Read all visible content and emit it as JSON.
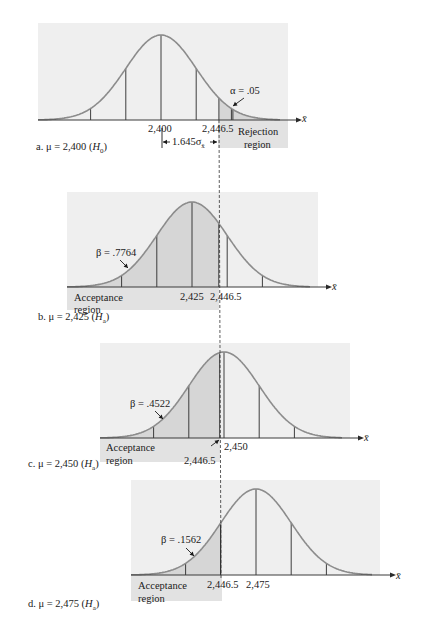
{
  "chart_data": [
    {
      "type": "area",
      "title": "a. μ = 2,400 (H0)",
      "panel": "a",
      "mu": 2400,
      "hypothesis": "H0",
      "xlabel": "x̄",
      "tick_labels": [
        "2,400",
        "2,446.5"
      ],
      "critical_value": 2446.5,
      "shaded_region": "right tail (rejection region)",
      "annotations": [
        "α = .05",
        "1.645σx̄",
        "Rejection region"
      ],
      "alpha": 0.05
    },
    {
      "type": "area",
      "title": "b. μ = 2,425 (Ha)",
      "panel": "b",
      "mu": 2425,
      "hypothesis": "Ha",
      "xlabel": "x̄",
      "tick_labels": [
        "2,425",
        "2,446.5"
      ],
      "critical_value": 2446.5,
      "shaded_region": "left of critical value (acceptance region)",
      "annotations": [
        "β = .7764",
        "Acceptance region"
      ],
      "beta": 0.7764
    },
    {
      "type": "area",
      "title": "c. μ = 2,450 (Ha)",
      "panel": "c",
      "mu": 2450,
      "hypothesis": "Ha",
      "xlabel": "x̄",
      "tick_labels": [
        "2,446.5",
        "2,450"
      ],
      "critical_value": 2446.5,
      "shaded_region": "left of critical value (acceptance region)",
      "annotations": [
        "β = .4522",
        "Acceptance region"
      ],
      "beta": 0.4522
    },
    {
      "type": "area",
      "title": "d. μ = 2,475 (Ha)",
      "panel": "d",
      "mu": 2475,
      "hypothesis": "Ha",
      "xlabel": "x̄",
      "tick_labels": [
        "2,446.5",
        "2,475"
      ],
      "critical_value": 2446.5,
      "shaded_region": "left of critical value (acceptance region)",
      "annotations": [
        "β = .1562",
        "Acceptance region"
      ],
      "beta": 0.1562
    }
  ],
  "panels": {
    "a": {
      "caption_prefix": "a. μ = 2,400 (",
      "caption_h": "H",
      "caption_sub": "0",
      "caption_suffix": ")",
      "tick_mu": "2,400",
      "tick_crit": "2,446.5",
      "alpha_label": "α = .05",
      "sigma_label": "1.645σ",
      "sigma_sub": "x̄",
      "region_line1": "Rejection",
      "region_line2": "region",
      "axis_label": "x̄"
    },
    "b": {
      "caption_prefix": "b. μ = 2,425 (",
      "caption_h": "H",
      "caption_sub": "a",
      "caption_suffix": ")",
      "tick_mu": "2,425",
      "tick_crit": "2,446.5",
      "beta_label": "β = .7764",
      "region_line1": "Acceptance",
      "region_line2": "region",
      "axis_label": "x̄"
    },
    "c": {
      "caption_prefix": "c. μ = 2,450 (",
      "caption_h": "H",
      "caption_sub": "a",
      "caption_suffix": ")",
      "tick_mu": "2,450",
      "tick_crit": "2,446.5",
      "beta_label": "β = .4522",
      "region_line1": "Acceptance",
      "region_line2": "region",
      "axis_label": "x̄"
    },
    "d": {
      "caption_prefix": "d. μ = 2,475 (",
      "caption_h": "H",
      "caption_sub": "a",
      "caption_suffix": ")",
      "tick_mu": "2,475",
      "tick_crit": "2,446.5",
      "beta_label": "β = .1562",
      "region_line1": "Acceptance",
      "region_line2": "region",
      "axis_label": "x̄"
    }
  },
  "colors": {
    "panel_bg": "#efefef",
    "shade": "#d6d6d6",
    "region_box": "#e2e2e2",
    "curve": "#8c8c8c",
    "lines": "#2a2a2a"
  }
}
